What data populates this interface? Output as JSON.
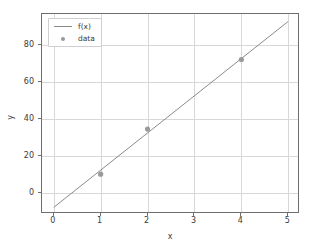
{
  "chart_data": {
    "type": "line",
    "title": "",
    "xlabel": "x",
    "ylabel": "y",
    "xlim": [
      -0.25,
      5.25
    ],
    "ylim": [
      -11.6,
      97.0
    ],
    "xticks": [
      0,
      1,
      2,
      3,
      4,
      5
    ],
    "xtick_labels": [
      "0",
      "1",
      "2",
      "3",
      "4",
      "5"
    ],
    "yticks": [
      0,
      20,
      40,
      60,
      80
    ],
    "ytick_labels": [
      "0",
      "20",
      "40",
      "60",
      "80"
    ],
    "grid": true,
    "legend_position": "upper left",
    "series": [
      {
        "name": "f(x)",
        "kind": "line",
        "color": "#8a8a8a",
        "x": [
          0,
          5
        ],
        "y": [
          -8.0,
          93.0
        ],
        "slope": 20.2,
        "intercept": -8.0
      },
      {
        "name": "data",
        "kind": "scatter",
        "color": "#9a9a9a",
        "x": [
          1,
          2,
          4
        ],
        "y": [
          10.0,
          34.5,
          72.3
        ]
      }
    ]
  },
  "legend": {
    "entries": [
      {
        "label": "f(x)"
      },
      {
        "label": "data"
      }
    ]
  },
  "colors": {
    "line": "#8a8a8a",
    "marker": "#9a9a9a",
    "grid": "#d8d8d8",
    "frame": "#6e6e6e",
    "text": "#3a3a3a",
    "background": "#ffffff"
  }
}
